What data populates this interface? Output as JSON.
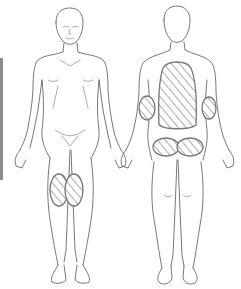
{
  "figure": {
    "type": "body-map",
    "views": [
      {
        "id": "front",
        "label": "anterior view"
      },
      {
        "id": "back",
        "label": "posterior view"
      }
    ],
    "marked_regions": [
      {
        "view": "front",
        "region": "left-thigh-knee"
      },
      {
        "view": "front",
        "region": "right-thigh-knee"
      },
      {
        "view": "back",
        "region": "back-torso"
      },
      {
        "view": "back",
        "region": "left-elbow"
      },
      {
        "view": "back",
        "region": "right-elbow"
      },
      {
        "view": "back",
        "region": "left-buttock"
      },
      {
        "view": "back",
        "region": "right-buttock"
      }
    ],
    "colors": {
      "outline": "#555555",
      "hatch": "#888888",
      "edge_bar": "#8a8a8a",
      "background": "#ffffff"
    }
  }
}
